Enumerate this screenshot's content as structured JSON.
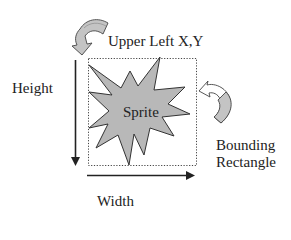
{
  "diagram": {
    "labels": {
      "upper_left": "Upper Left X,Y",
      "height": "Height",
      "sprite": "Sprite",
      "bounding_line1": "Bounding",
      "bounding_line2": "Rectangle",
      "width": "Width"
    },
    "colors": {
      "sprite_fill": "#b8b8b8",
      "outline": "#333333",
      "arrow_fill": "#c4c4c4",
      "text": "#222222",
      "background": "#ffffff"
    },
    "elements": [
      {
        "id": "bounding-rectangle",
        "style": "dotted",
        "x": 88,
        "y": 58,
        "width": 108,
        "height": 107
      },
      {
        "id": "height-arrow",
        "direction": "down",
        "x": 75,
        "y1": 60,
        "y2": 165
      },
      {
        "id": "width-arrow",
        "direction": "right",
        "y": 175,
        "x1": 87,
        "x2": 195
      },
      {
        "id": "sprite-star",
        "shape": "irregular-star",
        "fill": "gray"
      },
      {
        "id": "upper-left-pointer",
        "shape": "curved-arrow",
        "points_to": "upper-left corner"
      },
      {
        "id": "bounding-pointer",
        "shape": "curved-arrow",
        "points_to": "right edge of bounding rectangle"
      }
    ]
  }
}
